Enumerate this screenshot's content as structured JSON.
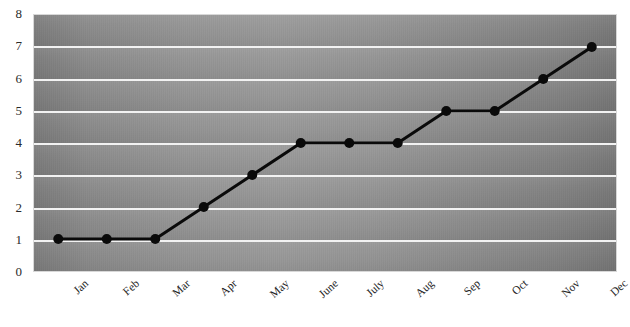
{
  "chart_data": {
    "type": "line",
    "title": "",
    "subtitle": "",
    "xlabel": "",
    "ylabel": "",
    "categories": [
      "Jan",
      "Feb",
      "Mar",
      "Apr",
      "May",
      "June",
      "July",
      "Aug",
      "Sep",
      "Oct",
      "Nov",
      "Dec"
    ],
    "values": [
      1,
      1,
      1,
      2,
      3,
      4,
      4,
      4,
      5,
      5,
      6,
      7
    ],
    "series": [
      {
        "name": "",
        "values": [
          1,
          1,
          1,
          2,
          3,
          4,
          4,
          4,
          5,
          5,
          6,
          7
        ]
      }
    ],
    "ylim": [
      0,
      8
    ],
    "yticks": [
      0,
      1,
      2,
      3,
      4,
      5,
      6,
      7,
      8
    ],
    "ytick_labels": [
      "0",
      "1",
      "2",
      "3",
      "4",
      "5",
      "6",
      "7",
      "8"
    ],
    "gridlines": {
      "horizontal": true,
      "vertical": false,
      "values": [
        1,
        2,
        3,
        4,
        5,
        6,
        7
      ],
      "color": "#f2f2f2"
    },
    "legend": {
      "visible": false,
      "position": "none",
      "entries": []
    },
    "marker": {
      "shape": "circle",
      "color": "#0a0a0a",
      "size": 5
    },
    "line": {
      "color": "#0a0a0a",
      "width": 3
    },
    "plot_background": {
      "style": "gray-gradient",
      "base_color": "#8d8d8d",
      "edge_color": "#6f6f6f",
      "center_color": "#a0a0a0"
    },
    "page_background": "#ffffff",
    "xtick_rotation_degrees": -42,
    "annotations": []
  },
  "axes": {
    "y": {
      "ticks": [
        "8",
        "7",
        "6",
        "5",
        "4",
        "3",
        "2",
        "1",
        "0"
      ]
    },
    "x": {
      "ticks": [
        "Jan",
        "Feb",
        "Mar",
        "Apr",
        "May",
        "June",
        "July",
        "Aug",
        "Sep",
        "Oct",
        "Nov",
        "Dec"
      ]
    }
  }
}
